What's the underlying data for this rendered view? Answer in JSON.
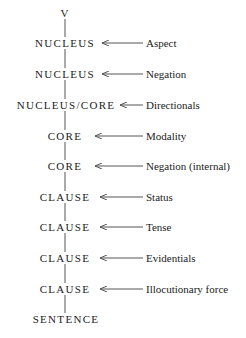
{
  "diagram": {
    "root": "V",
    "levels": [
      {
        "node": "NUCLEUS",
        "operator": "Aspect"
      },
      {
        "node": "NUCLEUS",
        "operator": "Negation"
      },
      {
        "node": "NUCLEUS/CORE",
        "operator": "Directionals"
      },
      {
        "node": "CORE",
        "operator": "Modality"
      },
      {
        "node": "CORE",
        "operator": "Negation (internal)"
      },
      {
        "node": "CLAUSE",
        "operator": "Status"
      },
      {
        "node": "CLAUSE",
        "operator": "Tense"
      },
      {
        "node": "CLAUSE",
        "operator": "Evidentials"
      },
      {
        "node": "CLAUSE",
        "operator": "Illocutionary force"
      }
    ],
    "bottom": "SENTENCE",
    "colors": {
      "text": "#222222",
      "line": "#555555",
      "background": "#ffffff"
    }
  }
}
